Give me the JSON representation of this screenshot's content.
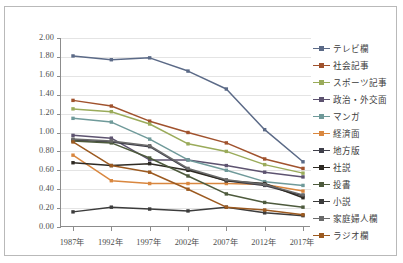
{
  "chart_data": {
    "type": "line",
    "title": "",
    "subtitle": "",
    "xlabel": "",
    "ylabel": "",
    "x": [
      "1987年",
      "1992年",
      "1997年",
      "2002年",
      "2007年",
      "2012年",
      "2017年"
    ],
    "ylim": [
      0.0,
      2.0
    ],
    "ytick_labels": [
      "0.00",
      "0.20",
      "0.40",
      "0.60",
      "0.80",
      "1.00",
      "1.20",
      "1.40",
      "1.60",
      "1.80",
      "2.00"
    ],
    "ytick_values": [
      0.0,
      0.2,
      0.4,
      0.6,
      0.8,
      1.0,
      1.2,
      1.4,
      1.6,
      1.8,
      2.0
    ],
    "grid": "horizontal",
    "legend_position": "right",
    "markers": "square",
    "series": [
      {
        "name": "テレビ欄",
        "color": "#5b6a87",
        "values": [
          1.81,
          1.77,
          1.79,
          1.65,
          1.46,
          1.03,
          0.69
        ]
      },
      {
        "name": "社会記事",
        "color": "#a0522d",
        "values": [
          1.34,
          1.28,
          1.12,
          1.0,
          0.89,
          0.72,
          0.62
        ]
      },
      {
        "name": "スポーツ記事",
        "color": "#9aab5a",
        "values": [
          1.25,
          1.22,
          1.09,
          0.88,
          0.8,
          0.66,
          0.57
        ]
      },
      {
        "name": "政治・外交面",
        "color": "#5d5370",
        "values": [
          0.97,
          0.94,
          0.71,
          0.71,
          0.65,
          0.58,
          0.53
        ]
      },
      {
        "name": "マンガ",
        "color": "#6f9a9a",
        "values": [
          1.15,
          1.11,
          0.93,
          0.71,
          0.6,
          0.48,
          0.44
        ]
      },
      {
        "name": "経済面",
        "color": "#d9873f",
        "values": [
          0.76,
          0.49,
          0.46,
          0.46,
          0.46,
          0.45,
          0.38
        ]
      },
      {
        "name": "地方版",
        "color": "#3f3f4a",
        "values": [
          0.92,
          0.9,
          0.85,
          0.61,
          0.49,
          0.44,
          0.33
        ]
      },
      {
        "name": "社説",
        "color": "#2e2a23",
        "values": [
          0.68,
          0.65,
          0.67,
          0.6,
          0.49,
          0.46,
          0.31
        ]
      },
      {
        "name": "投書",
        "color": "#4d5a3c",
        "values": [
          0.91,
          0.89,
          0.73,
          0.54,
          0.35,
          0.26,
          0.21
        ]
      },
      {
        "name": "小説",
        "color": "#3c3c3c",
        "values": [
          0.16,
          0.21,
          0.19,
          0.17,
          0.21,
          0.15,
          0.12
        ]
      },
      {
        "name": "家庭婦人欄",
        "color": "#6a6a6a",
        "values": [
          0.93,
          0.91,
          0.86,
          0.62,
          0.5,
          0.45,
          0.34
        ]
      },
      {
        "name": "ラジオ欄",
        "color": "#9c5a20",
        "values": [
          0.9,
          0.65,
          0.58,
          0.4,
          0.21,
          0.18,
          0.13
        ]
      }
    ]
  },
  "legend": {
    "items": [
      "テレビ欄",
      "社会記事",
      "スポーツ記事",
      "政治・外交面",
      "マンガ",
      "経済面",
      "地方版",
      "社説",
      "投書",
      "小説",
      "家庭婦人欄",
      "ラジオ欄"
    ]
  }
}
